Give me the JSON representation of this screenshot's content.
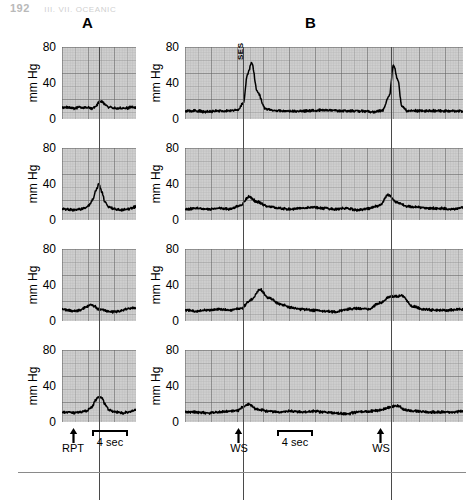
{
  "runhead": {
    "page": "192",
    "title": "III. VII. OCEANIC"
  },
  "panels": [
    {
      "id": "A",
      "label": "A",
      "left": 82,
      "top": 16
    },
    {
      "id": "B",
      "label": "B",
      "left": 305,
      "top": 16
    }
  ],
  "axis": {
    "unit_label": "mm Hg",
    "ticks": [
      "80",
      "40",
      "0"
    ],
    "tick_values": [
      80,
      40,
      0
    ],
    "ymin": 0,
    "ymax": 80
  },
  "annotations": {
    "a_stimulus_label": "RPT",
    "b_stimulus_label_1": "WS",
    "b_stimulus_label_2": "WS",
    "scalebar_label_a": "4 sec",
    "scalebar_label_b": "4 sec",
    "peak_label_b1": "SES"
  },
  "chart_data": {
    "type": "line",
    "title": "",
    "xlabel": "time",
    "ylabel": "mm Hg",
    "ylim": [
      0,
      80
    ],
    "grid": true,
    "legend": "none",
    "columns": [
      {
        "id": "A",
        "label": "A",
        "stimulus": "RPT",
        "stimulus_x_frac": [
          0.5
        ],
        "scalebar_seconds": 4,
        "duration_seconds": 12,
        "rows": [
          {
            "row": 1,
            "baseline": 13,
            "peak": 20,
            "x": [
              0.0,
              0.08,
              0.16,
              0.24,
              0.32,
              0.4,
              0.46,
              0.5,
              0.54,
              0.58,
              0.64,
              0.7,
              0.78,
              0.86,
              0.94,
              1.0
            ],
            "y": [
              13,
              13,
              12,
              13,
              13,
              12,
              14,
              19,
              20,
              16,
              13,
              12,
              12,
              12,
              13,
              13
            ]
          },
          {
            "row": 2,
            "baseline": 12,
            "peak": 40,
            "x": [
              0.0,
              0.08,
              0.16,
              0.24,
              0.3,
              0.36,
              0.42,
              0.46,
              0.5,
              0.54,
              0.58,
              0.64,
              0.72,
              0.8,
              0.88,
              0.94,
              1.0
            ],
            "y": [
              12,
              12,
              11,
              12,
              13,
              16,
              23,
              33,
              40,
              31,
              20,
              14,
              12,
              11,
              12,
              13,
              15
            ]
          },
          {
            "row": 3,
            "baseline": 12,
            "peak": 18,
            "x": [
              0.0,
              0.08,
              0.16,
              0.24,
              0.32,
              0.38,
              0.44,
              0.5,
              0.56,
              0.62,
              0.7,
              0.78,
              0.86,
              0.94,
              1.0
            ],
            "y": [
              13,
              12,
              11,
              12,
              15,
              18,
              16,
              13,
              12,
              11,
              10,
              11,
              13,
              14,
              15
            ]
          },
          {
            "row": 4,
            "baseline": 11,
            "peak": 28,
            "x": [
              0.0,
              0.08,
              0.16,
              0.24,
              0.32,
              0.4,
              0.46,
              0.5,
              0.54,
              0.58,
              0.64,
              0.72,
              0.8,
              0.88,
              0.94,
              1.0
            ],
            "y": [
              11,
              11,
              10,
              11,
              12,
              16,
              25,
              28,
              27,
              20,
              13,
              11,
              10,
              11,
              12,
              14
            ]
          }
        ]
      },
      {
        "id": "B",
        "label": "B",
        "stimulus": "WS",
        "stimulus_x_frac": [
          0.21,
          0.74
        ],
        "scalebar_seconds": 4,
        "duration_seconds": 40,
        "rows": [
          {
            "row": 1,
            "baseline": 9,
            "peaks": [
              62,
              60
            ],
            "annotation": "SES",
            "x": [
              0.0,
              0.04,
              0.08,
              0.12,
              0.16,
              0.19,
              0.21,
              0.225,
              0.24,
              0.26,
              0.29,
              0.33,
              0.38,
              0.44,
              0.5,
              0.56,
              0.62,
              0.68,
              0.71,
              0.735,
              0.75,
              0.765,
              0.78,
              0.8,
              0.84,
              0.88,
              0.92,
              0.96,
              1.0
            ],
            "y": [
              9,
              9,
              8,
              9,
              9,
              10,
              18,
              50,
              62,
              30,
              11,
              9,
              9,
              9,
              10,
              9,
              9,
              8,
              9,
              26,
              60,
              44,
              14,
              9,
              9,
              9,
              9,
              9,
              9
            ]
          },
          {
            "row": 2,
            "baseline": 13,
            "peaks": [
              26,
              28
            ],
            "x": [
              0.0,
              0.04,
              0.08,
              0.12,
              0.16,
              0.2,
              0.23,
              0.26,
              0.3,
              0.34,
              0.38,
              0.42,
              0.46,
              0.5,
              0.54,
              0.58,
              0.62,
              0.66,
              0.7,
              0.73,
              0.76,
              0.8,
              0.84,
              0.88,
              0.92,
              0.96,
              1.0
            ],
            "y": [
              12,
              13,
              12,
              13,
              12,
              16,
              26,
              20,
              15,
              13,
              12,
              13,
              14,
              13,
              12,
              13,
              11,
              13,
              16,
              28,
              20,
              15,
              14,
              13,
              13,
              12,
              14
            ]
          },
          {
            "row": 3,
            "baseline": 12,
            "peaks": [
              35,
              28
            ],
            "x": [
              0.0,
              0.04,
              0.08,
              0.12,
              0.16,
              0.2,
              0.24,
              0.27,
              0.3,
              0.34,
              0.38,
              0.42,
              0.46,
              0.5,
              0.54,
              0.58,
              0.62,
              0.66,
              0.7,
              0.74,
              0.78,
              0.82,
              0.86,
              0.9,
              0.94,
              1.0
            ],
            "y": [
              12,
              11,
              12,
              13,
              12,
              14,
              24,
              35,
              26,
              19,
              15,
              13,
              12,
              11,
              10,
              13,
              14,
              13,
              20,
              27,
              28,
              16,
              13,
              12,
              12,
              13
            ]
          },
          {
            "row": 4,
            "baseline": 11,
            "peaks": [
              20,
              18
            ],
            "x": [
              0.0,
              0.04,
              0.08,
              0.12,
              0.16,
              0.19,
              0.21,
              0.23,
              0.26,
              0.3,
              0.34,
              0.38,
              0.42,
              0.46,
              0.5,
              0.54,
              0.58,
              0.62,
              0.66,
              0.7,
              0.73,
              0.76,
              0.8,
              0.84,
              0.88,
              0.92,
              0.96,
              1.0
            ],
            "y": [
              11,
              11,
              10,
              11,
              12,
              13,
              17,
              20,
              14,
              12,
              11,
              12,
              11,
              12,
              11,
              10,
              9,
              11,
              12,
              13,
              16,
              18,
              13,
              12,
              11,
              11,
              11,
              12
            ]
          }
        ]
      }
    ]
  }
}
